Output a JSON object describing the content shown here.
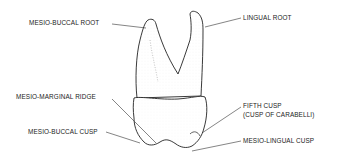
{
  "diagram": {
    "labels": {
      "mesio_buccal_root": "MESIO-BUCCAL ROOT",
      "lingual_root": "LINGUAL ROOT",
      "mesio_marginal_ridge": "MESIO-MARGINAL RIDGE",
      "mesio_buccal_cusp": "MESIO-BUCCAL CUSP",
      "fifth_cusp_line1": "FIFTH CUSP",
      "fifth_cusp_line2": "(CUSP OF CARABELLI)",
      "mesio_lingual_cusp": "MESIO-LINGUAL CUSP"
    }
  }
}
